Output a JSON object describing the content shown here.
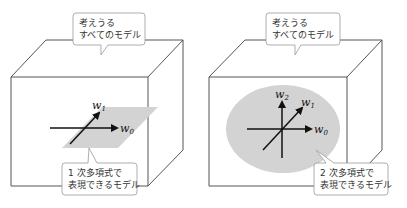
{
  "panels": [
    {
      "id": "left",
      "top_callout": {
        "line1": "考えうる",
        "line2": "すべてのモデル"
      },
      "bottom_callout": {
        "line1": "1 次多項式で",
        "line2": "表現できるモデル"
      },
      "region_shape": "parallelogram-plane",
      "axes": [
        {
          "name": "w",
          "sub": "0"
        },
        {
          "name": "w",
          "sub": "1"
        }
      ]
    },
    {
      "id": "right",
      "top_callout": {
        "line1": "考えうる",
        "line2": "すべてのモデル"
      },
      "bottom_callout": {
        "line1": "2 次多項式で",
        "line2": "表現できるモデル"
      },
      "region_shape": "ellipse-volume",
      "axes": [
        {
          "name": "w",
          "sub": "0"
        },
        {
          "name": "w",
          "sub": "1"
        },
        {
          "name": "w",
          "sub": "2"
        }
      ]
    }
  ],
  "colors": {
    "cube_stroke": "#555555",
    "region_fill": "#d3d3d3",
    "bubble_stroke": "#999999",
    "axis_stroke": "#111111"
  }
}
